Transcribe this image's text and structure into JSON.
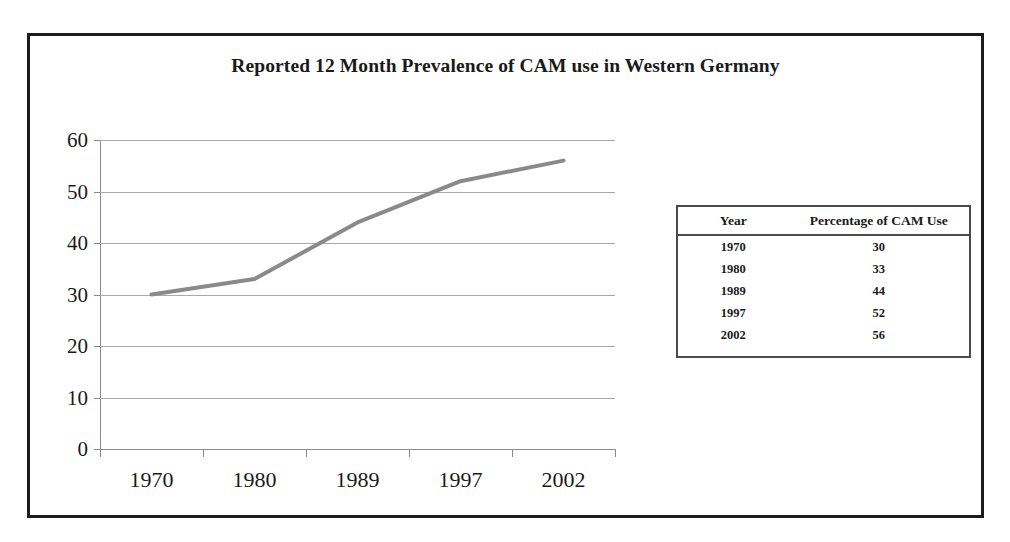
{
  "chart_data": {
    "type": "line",
    "title": "Reported 12 Month Prevalence of CAM use in Western Germany",
    "xlabel": "",
    "ylabel": "",
    "categories": [
      "1970",
      "1980",
      "1989",
      "1997",
      "2002"
    ],
    "values": [
      30,
      33,
      44,
      52,
      56
    ],
    "series": [
      {
        "name": "Percentage of CAM Use",
        "values": [
          30,
          33,
          44,
          52,
          56
        ]
      }
    ],
    "ylim": [
      0,
      60
    ],
    "yticks": [
      "60",
      "50",
      "40",
      "30",
      "20",
      "10",
      "0"
    ],
    "ytick_values": [
      60,
      50,
      40,
      30,
      20,
      10,
      0
    ],
    "grid": true,
    "legend": "none",
    "line_color": "#8a8a8a",
    "axis_color": "#8c8c8c",
    "gridline_color": "#a9a9a9",
    "frame_color": "#1c1c1c"
  },
  "data_table": {
    "headers": [
      "Year",
      "Percentage of CAM Use"
    ],
    "rows": [
      {
        "year": "1970",
        "percentage": "30"
      },
      {
        "year": "1980",
        "percentage": "33"
      },
      {
        "year": "1989",
        "percentage": "44"
      },
      {
        "year": "1997",
        "percentage": "52"
      },
      {
        "year": "2002",
        "percentage": "56"
      }
    ]
  }
}
